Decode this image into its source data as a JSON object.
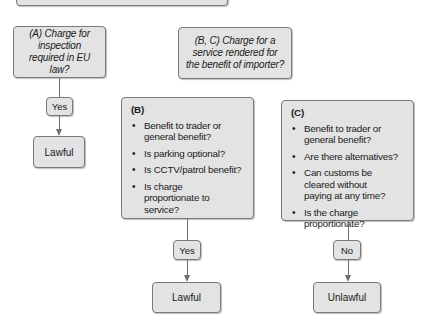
{
  "diagram": {
    "top_box": {
      "label": ""
    },
    "node_a": {
      "question": "(A) Charge for inspection required in EU law?",
      "answer": "Yes",
      "result": "Lawful"
    },
    "node_bc": {
      "question": "(B, C) Charge for a service rendered for the benefit of importer?"
    },
    "node_b": {
      "title": "(B)",
      "bullet": "•",
      "items": [
        "Benefit to trader or general benefit?",
        "Is parking optional?",
        "Is CCTV/patrol benefit?",
        "Is charge proportionate to service?"
      ],
      "answer": "Yes",
      "result": "Lawful"
    },
    "node_c": {
      "title": "(C)",
      "bullet": "•",
      "items": [
        "Benefit to trader or general benefit?",
        "Are there alternatives?",
        "Can customs be cleared without paying at any time?",
        "Is the charge proportionate?"
      ],
      "answer": "No",
      "result": "Unlawful"
    },
    "colors": {
      "box_fill": "#e3e3e3",
      "box_border": "#7a7a7a",
      "connector": "#6f6f6f"
    }
  }
}
